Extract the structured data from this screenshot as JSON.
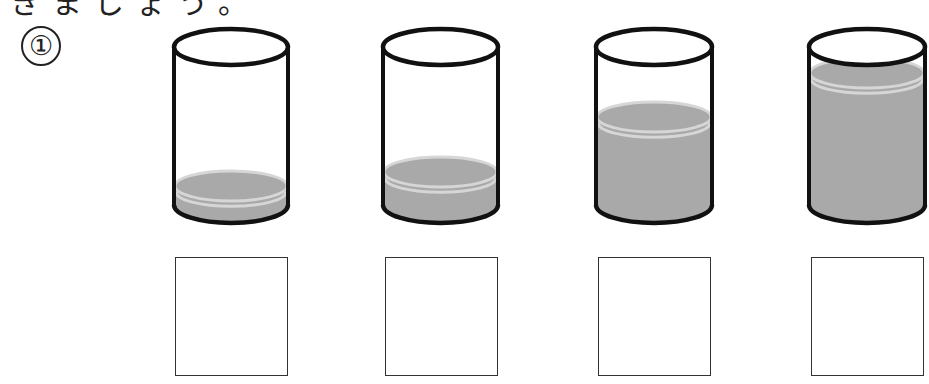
{
  "header": {
    "cropped_text": "きましょう。"
  },
  "question": {
    "number": "①"
  },
  "colors": {
    "water": "#a9a9a9",
    "water_rim": "#d6d6d6",
    "outline": "#111111",
    "box_border": "#333333"
  },
  "cylinders": [
    {
      "id": 1,
      "x": 172,
      "width": 118,
      "water_surface_y": 186
    },
    {
      "id": 2,
      "x": 381,
      "width": 119,
      "water_surface_y": 172
    },
    {
      "id": 3,
      "x": 594,
      "width": 120,
      "water_surface_y": 117
    },
    {
      "id": 4,
      "x": 807,
      "width": 120,
      "water_surface_y": 73
    }
  ],
  "answer_boxes": [
    {
      "id": 1,
      "x": 175,
      "value": ""
    },
    {
      "id": 2,
      "x": 385,
      "value": ""
    },
    {
      "id": 3,
      "x": 598,
      "value": ""
    },
    {
      "id": 4,
      "x": 811,
      "value": ""
    }
  ]
}
